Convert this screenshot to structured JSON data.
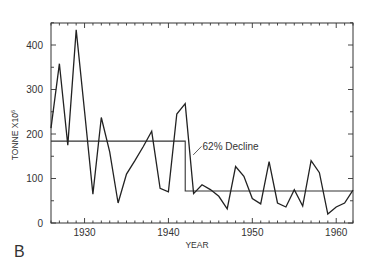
{
  "panel_label": "B",
  "chart_data": {
    "type": "line",
    "title": "",
    "xlabel": "YEAR",
    "ylabel": "TONNE X10",
    "ylabel_superscript": "6",
    "xlim": [
      1926,
      1962
    ],
    "ylim": [
      0,
      450
    ],
    "xticks_major": [
      1930,
      1940,
      1950,
      1960
    ],
    "yticks_major": [
      0,
      100,
      200,
      300,
      400
    ],
    "grid": false,
    "legend": null,
    "series": [
      {
        "name": "catch",
        "x": [
          1926,
          1927,
          1928,
          1929,
          1930,
          1931,
          1932,
          1933,
          1934,
          1935,
          1936,
          1937,
          1938,
          1939,
          1940,
          1941,
          1942,
          1943,
          1944,
          1945,
          1946,
          1947,
          1948,
          1949,
          1950,
          1951,
          1952,
          1953,
          1954,
          1955,
          1956,
          1957,
          1958,
          1959,
          1960,
          1961,
          1962
        ],
        "values": [
          213,
          358,
          175,
          434,
          250,
          65,
          237,
          160,
          45,
          110,
          140,
          172,
          206,
          78,
          70,
          245,
          268,
          66,
          86,
          75,
          60,
          32,
          127,
          105,
          55,
          43,
          138,
          45,
          36,
          75,
          38,
          140,
          113,
          20,
          36,
          45,
          74
        ]
      }
    ],
    "mean_lines": [
      {
        "name": "mean-1926-1942",
        "x_start": 1926,
        "x_end": 1942,
        "value": 184
      },
      {
        "name": "mean-1942-1962",
        "x_start": 1942,
        "x_end": 1962,
        "value": 72
      }
    ],
    "annotations": [
      {
        "text": "62% Decline",
        "x": 1944.3,
        "y": 170
      }
    ]
  }
}
